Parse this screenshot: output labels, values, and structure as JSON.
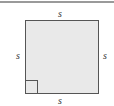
{
  "diagram": {
    "shape": "square",
    "fill_color": "#e9e9e9",
    "stroke_color": "#555555",
    "labels": {
      "top": "s",
      "left": "s",
      "right": "s",
      "bottom": "s"
    },
    "right_angle_marker": "bottom-left"
  }
}
